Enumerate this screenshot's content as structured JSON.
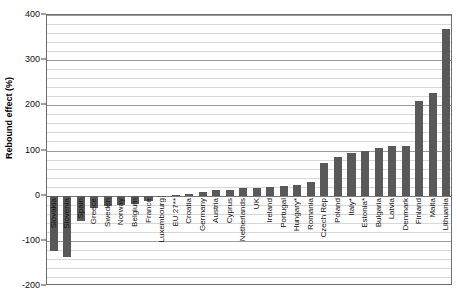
{
  "chart_data": {
    "type": "bar",
    "title": "",
    "xlabel": "",
    "ylabel": "Rebound effect (%)",
    "ylim": [
      -200,
      400
    ],
    "ytick_values": [
      400,
      300,
      200,
      100,
      0,
      -100,
      -200
    ],
    "ytick_labels": [
      "400",
      "300",
      "200",
      "100",
      "0",
      "-100",
      "-200"
    ],
    "ymajor_step": 100,
    "yminor_step": 20,
    "grid": true,
    "legend": "none",
    "bar_color": "#595959",
    "categories": [
      "Slovakia",
      "Slovenia",
      "Spain",
      "Greece",
      "Sweden",
      "Norway",
      "Belgium",
      "France",
      "Luxembourg",
      "EU 27**",
      "Croatia",
      "Germany",
      "Austria",
      "Cyprus",
      "Netherlands",
      "UK",
      "Ireland",
      "Portugal",
      "Hungary*",
      "Romania",
      "Czech Rep",
      "Poland",
      "Italy*",
      "Estonia*",
      "Bulgaria",
      "Latvia",
      "Denmark",
      "Finland",
      "Malta",
      "Lithuania"
    ],
    "values": [
      -123,
      -136,
      -57,
      -28,
      -22,
      -20,
      -18,
      -12,
      -4,
      2,
      4,
      9,
      12,
      13,
      17,
      18,
      19,
      22,
      24,
      30,
      72,
      85,
      95,
      98,
      105,
      110,
      111,
      210,
      228,
      368
    ]
  }
}
